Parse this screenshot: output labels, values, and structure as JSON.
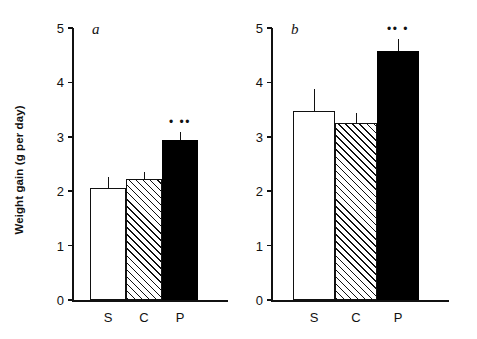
{
  "figure": {
    "ylabel": "Weight gain (g per day)"
  },
  "chart_data": [
    {
      "type": "bar",
      "panel_label": "a",
      "title": "",
      "xlabel": "",
      "ylabel": "Weight gain (g per day)",
      "ylim": [
        0,
        5
      ],
      "yticks": [
        0,
        1,
        2,
        3,
        4,
        5
      ],
      "ytick_labels": [
        "0",
        "1",
        "2",
        "3",
        "4",
        "5"
      ],
      "grid": false,
      "legend": "none",
      "categories": [
        "S",
        "C",
        "P"
      ],
      "values": [
        2.05,
        2.22,
        2.94
      ],
      "errors": [
        0.22,
        0.14,
        0.15
      ],
      "bar_styles": [
        "white",
        "hatched",
        "black"
      ],
      "annotations": [
        "",
        "",
        "• ••"
      ]
    },
    {
      "type": "bar",
      "panel_label": "b",
      "title": "",
      "xlabel": "",
      "ylabel": "Weight gain (g per day)",
      "ylim": [
        0,
        5
      ],
      "yticks": [
        0,
        1,
        2,
        3,
        4,
        5
      ],
      "ytick_labels": [
        "0",
        "1",
        "2",
        "3",
        "4",
        "5"
      ],
      "grid": false,
      "legend": "none",
      "categories": [
        "S",
        "C",
        "P"
      ],
      "values": [
        3.48,
        3.25,
        4.57
      ],
      "errors": [
        0.4,
        0.18,
        0.22
      ],
      "bar_styles": [
        "white",
        "hatched",
        "black"
      ],
      "annotations": [
        "",
        "",
        "•• •"
      ]
    }
  ]
}
